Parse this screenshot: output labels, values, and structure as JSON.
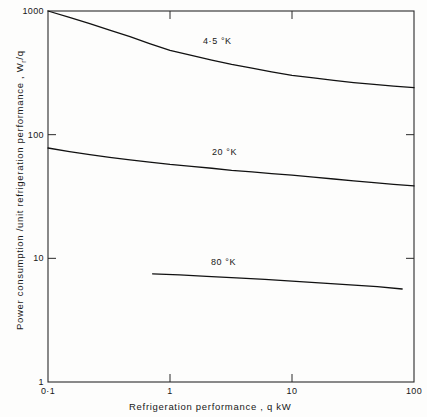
{
  "chart_data": {
    "type": "line",
    "title": "",
    "subtitle": "",
    "xlabel": "Refrigeration  performance ,  q  kW",
    "ylabel": "Power  consumption /unit  refrigeration  performance ,  W",
    "ylabel_sub": "r",
    "ylabel_tail": "/q",
    "xscale": "log",
    "yscale": "log",
    "xlim": [
      0.1,
      100
    ],
    "ylim": [
      1,
      1000
    ],
    "grid": false,
    "legend": "inline-curve-labels",
    "xticks": [
      {
        "value": 0.1,
        "label": "0·1"
      },
      {
        "value": 1,
        "label": "1"
      },
      {
        "value": 10,
        "label": "10"
      },
      {
        "value": 100,
        "label": "100"
      }
    ],
    "yticks": [
      {
        "value": 1,
        "label": "1"
      },
      {
        "value": 10,
        "label": "10"
      },
      {
        "value": 100,
        "label": "100"
      },
      {
        "value": 1000,
        "label": "1000"
      }
    ],
    "series": [
      {
        "name": "4·5 °K",
        "label": "4·5 °K",
        "color": "#111111",
        "x": [
          0.1,
          0.15,
          0.22,
          0.32,
          0.47,
          0.68,
          1.0,
          1.5,
          2.2,
          3.2,
          4.7,
          6.8,
          10,
          15,
          22,
          32,
          47,
          68,
          100
        ],
        "values": [
          1000,
          890,
          790,
          700,
          620,
          545,
          480,
          437,
          400,
          370,
          345,
          322,
          302,
          288,
          275,
          264,
          255,
          247,
          240
        ]
      },
      {
        "name": "20 °K",
        "label": "20 °K",
        "color": "#111111",
        "x": [
          0.1,
          0.15,
          0.22,
          0.32,
          0.47,
          0.68,
          1.0,
          1.5,
          2.2,
          3.2,
          4.7,
          6.8,
          10,
          15,
          22,
          32,
          47,
          68,
          100
        ],
        "values": [
          78,
          73,
          69,
          65.5,
          62.5,
          60,
          57.5,
          55.5,
          53.5,
          51.5,
          50,
          48.5,
          47,
          45.3,
          43.8,
          42.3,
          41,
          39.7,
          38.5
        ]
      },
      {
        "name": "80 °K",
        "label": "80 °K",
        "color": "#111111",
        "x": [
          0.72,
          1.2,
          2.0,
          3.5,
          6.0,
          10,
          18,
          30,
          50,
          80
        ],
        "values": [
          7.5,
          7.35,
          7.15,
          6.95,
          6.75,
          6.55,
          6.3,
          6.1,
          5.9,
          5.65
        ]
      }
    ],
    "annotations": [
      {
        "text": "4·5 °K",
        "x_px": 203,
        "y_px": 42
      },
      {
        "text": "20 °K",
        "x_px": 212,
        "y_px": 153
      },
      {
        "text": "80 °K",
        "x_px": 211,
        "y_px": 263
      }
    ]
  },
  "axes": {
    "x_title": "Refrigeration  performance ,  q  kW",
    "y_title_main": "Power  consumption /unit  refrigeration  performance ,  W",
    "y_title_sub": "r",
    "y_title_tail": "/q"
  },
  "ticks": {
    "x": [
      "0·1",
      "1",
      "10",
      "100"
    ],
    "y": [
      "1000",
      "100",
      "10",
      "1"
    ]
  },
  "curve_labels": {
    "c1": "4·5 °K",
    "c2": "20 °K",
    "c3": "80 °K"
  },
  "colors": {
    "line": "#111111",
    "axis": "#2a2a2a",
    "background": "#fdfdfc"
  }
}
